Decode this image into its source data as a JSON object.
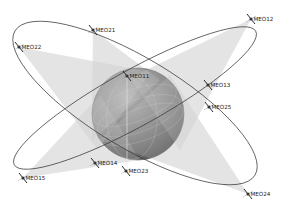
{
  "diagram": {
    "type": "satellite-constellation",
    "background": "#ffffff",
    "colors": {
      "earth_dark": "#5e5e5e",
      "earth_mid": "#8a8a8a",
      "earth_light": "#b5b5b5",
      "coverage": "#c8c8c8",
      "orbit_line": "#3a3a3a",
      "label": "#222222"
    },
    "earth": {
      "cx": 138,
      "cy": 114,
      "r": 46
    },
    "orbits": [
      {
        "id": "plane-2",
        "cx": 135,
        "cy": 103,
        "rx": 140,
        "ry": 45,
        "rotation": 31
      },
      {
        "id": "plane-1",
        "cx": 135,
        "cy": 98,
        "rx": 138,
        "ry": 28,
        "rotation": -29
      }
    ],
    "satellites": [
      {
        "label": "MEO22",
        "x": 19,
        "y": 47
      },
      {
        "label": "MEO21",
        "x": 93,
        "y": 30
      },
      {
        "label": "MEO12",
        "x": 251,
        "y": 19
      },
      {
        "label": "MEO11",
        "x": 127,
        "y": 76
      },
      {
        "label": "MEO13",
        "x": 208,
        "y": 85
      },
      {
        "label": "MEO25",
        "x": 209,
        "y": 107
      },
      {
        "label": "MEO14",
        "x": 95,
        "y": 163
      },
      {
        "label": "MEO23",
        "x": 126,
        "y": 171
      },
      {
        "label": "MEO15",
        "x": 23,
        "y": 178
      },
      {
        "label": "MEO24",
        "x": 248,
        "y": 194
      }
    ],
    "coverage_cones": [
      {
        "from": "MEO22",
        "points": [
          [
            19,
            47
          ],
          [
            150,
            72
          ],
          [
            98,
            150
          ]
        ]
      },
      {
        "from": "MEO21",
        "points": [
          [
            93,
            30
          ],
          [
            160,
            80
          ],
          [
            92,
            140
          ]
        ]
      },
      {
        "from": "MEO12",
        "points": [
          [
            251,
            19
          ],
          [
            130,
            78
          ],
          [
            180,
            150
          ]
        ]
      },
      {
        "from": "MEO15",
        "points": [
          [
            23,
            178
          ],
          [
            100,
            95
          ],
          [
            140,
            160
          ]
        ]
      },
      {
        "from": "MEO24",
        "points": [
          [
            248,
            194
          ],
          [
            170,
            75
          ],
          [
            100,
            140
          ]
        ]
      }
    ]
  }
}
